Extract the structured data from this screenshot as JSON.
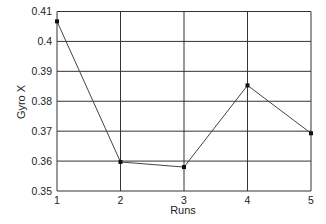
{
  "chart_data": {
    "type": "line",
    "title": "",
    "xlabel": "Runs",
    "ylabel": "Gyro X",
    "x": [
      1,
      2,
      3,
      4,
      5
    ],
    "categories": [
      "1",
      "2",
      "3",
      "4",
      "5"
    ],
    "series": [
      {
        "name": "Gyro X",
        "values": [
          0.4067,
          0.3597,
          0.358,
          0.3853,
          0.3693
        ]
      }
    ],
    "ylim": [
      0.35,
      0.41
    ],
    "yticks": [
      0.35,
      0.36,
      0.37,
      0.38,
      0.39,
      0.4,
      0.41
    ],
    "ytick_labels": [
      "0.35",
      "0.36",
      "0.37",
      "0.38",
      "0.39",
      "0.4",
      "0.41"
    ],
    "xticks": [
      1,
      2,
      3,
      4,
      5
    ],
    "grid": true,
    "legend": null,
    "colors": {
      "line": "#444444",
      "marker": "#111111",
      "grid": "#333333"
    }
  }
}
